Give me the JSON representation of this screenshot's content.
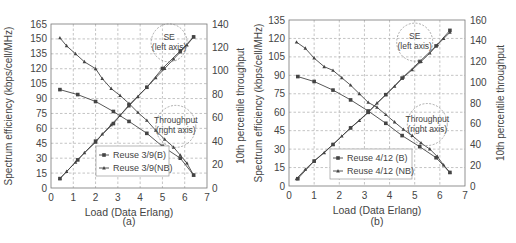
{
  "chart_data": [
    {
      "type": "line",
      "panel_label": "(a)",
      "title": "",
      "xlabel": "Load (Data Erlang)",
      "ylabel": "Spectrum efficiency (kbps/cell/MHz)",
      "y2label": "10th percentile throughput",
      "xlim": [
        0,
        7
      ],
      "ylim": [
        0,
        165
      ],
      "y2lim": [
        0,
        140
      ],
      "xticks": [
        0,
        1,
        2,
        3,
        4,
        5,
        6,
        7
      ],
      "yticks": [
        0,
        15,
        30,
        45,
        60,
        75,
        90,
        105,
        120,
        135,
        150,
        165
      ],
      "y2ticks": [
        0,
        20,
        40,
        60,
        80,
        100,
        120,
        140
      ],
      "grid": true,
      "legend": [
        "Reuse 3/9(B)",
        "Reuse 3/9(NB)"
      ],
      "annotations": [
        {
          "text": "SE",
          "text2": "(left axis)",
          "x": 5.3,
          "y": 146,
          "axis": "left"
        },
        {
          "text": "Throughput",
          "text2": "(right axis)",
          "x": 5.6,
          "y": 62,
          "axis": "left"
        }
      ],
      "series": [
        {
          "name": "Reuse 3/9(B)",
          "metric": "SE",
          "axis": "left",
          "marker": "square",
          "x": [
            0.4,
            1.2,
            2.0,
            2.8,
            3.5,
            4.3,
            5.0,
            5.8,
            6.4
          ],
          "values": [
            99,
            94,
            87,
            77,
            67,
            55,
            42,
            30,
            13
          ]
        },
        {
          "name": "Reuse 3/9(NB)",
          "metric": "SE",
          "axis": "left",
          "marker": "triangle",
          "x": [
            0.4,
            0.7,
            1.1,
            1.5,
            2.0,
            2.3,
            2.7,
            3.1,
            3.5,
            3.9,
            4.3,
            4.7,
            5.1,
            5.5,
            5.8,
            6.1,
            6.4
          ],
          "values": [
            151,
            143,
            135,
            127,
            120,
            110,
            100,
            93,
            85,
            76,
            68,
            58,
            49,
            41,
            33,
            25,
            13
          ]
        },
        {
          "name": "Reuse 3/9(B)",
          "metric": "Throughput",
          "axis": "right",
          "marker": "square",
          "x": [
            0.4,
            1.2,
            2.0,
            2.8,
            3.5,
            4.3,
            5.0,
            5.8,
            6.4
          ],
          "values": [
            8,
            24,
            40,
            55,
            71,
            86,
            102,
            117,
            129
          ]
        },
        {
          "name": "Reuse 3/9(NB)",
          "metric": "Throughput",
          "axis": "right",
          "marker": "triangle",
          "x": [
            0.4,
            0.7,
            1.1,
            1.5,
            2.0,
            2.3,
            2.7,
            3.1,
            3.5,
            3.9,
            4.3,
            4.7,
            5.1,
            5.5,
            5.8,
            6.1,
            6.4
          ],
          "values": [
            8,
            14,
            22,
            30,
            39,
            46,
            54,
            62,
            70,
            78,
            86,
            94,
            102,
            110,
            116,
            122,
            129
          ]
        }
      ]
    },
    {
      "type": "line",
      "panel_label": "(b)",
      "title": "",
      "xlabel": "Load (Data Erlang)",
      "ylabel": "Spectrum efficiency (kbps/cell/MHz)",
      "y2label": "10th percentile throughput",
      "xlim": [
        0,
        7
      ],
      "ylim": [
        0,
        135
      ],
      "y2lim": [
        0,
        160
      ],
      "xticks": [
        0,
        1,
        2,
        3,
        4,
        5,
        6,
        7
      ],
      "yticks": [
        0,
        15,
        30,
        45,
        60,
        75,
        90,
        105,
        120,
        135
      ],
      "y2ticks": [
        0,
        20,
        40,
        60,
        80,
        100,
        120,
        140,
        160
      ],
      "grid": true,
      "legend": [
        "Reuse 4/12 (B)",
        "Reuse 4/12 (NB)"
      ],
      "annotations": [
        {
          "text": "SE",
          "text2": "(left axis)",
          "x": 5.0,
          "y": 117,
          "axis": "left"
        },
        {
          "text": "Throughput",
          "text2": "(right axis)",
          "x": 5.5,
          "y": 50,
          "axis": "left"
        }
      ],
      "series": [
        {
          "name": "Reuse 4/12 (B)",
          "metric": "SE",
          "axis": "left",
          "marker": "square",
          "x": [
            0.35,
            1.0,
            1.75,
            2.45,
            3.15,
            3.85,
            4.5,
            5.2,
            5.85,
            6.4
          ],
          "values": [
            89,
            85,
            78,
            70,
            61,
            51,
            41,
            32,
            23,
            11
          ]
        },
        {
          "name": "Reuse 4/12 (NB)",
          "metric": "SE",
          "axis": "left",
          "marker": "triangle",
          "x": [
            0.3,
            0.65,
            1.0,
            1.4,
            1.75,
            2.1,
            2.45,
            2.8,
            3.15,
            3.5,
            3.85,
            4.2,
            4.55,
            4.9,
            5.25,
            5.6,
            5.9,
            6.15,
            6.4
          ],
          "values": [
            117,
            112,
            104,
            97,
            94,
            88,
            82,
            75,
            68,
            64,
            58,
            52,
            46,
            41,
            35,
            30,
            24,
            17,
            11
          ]
        },
        {
          "name": "Reuse 4/12 (B)",
          "metric": "Throughput",
          "axis": "right",
          "marker": "square",
          "x": [
            0.35,
            1.0,
            1.75,
            2.45,
            3.15,
            3.85,
            4.5,
            5.2,
            5.85,
            6.4
          ],
          "values": [
            7,
            24,
            40,
            56,
            71,
            88,
            104,
            120,
            135,
            150
          ]
        },
        {
          "name": "Reuse 4/12 (NB)",
          "metric": "Throughput",
          "axis": "right",
          "marker": "triangle",
          "x": [
            0.3,
            0.65,
            1.0,
            1.4,
            1.75,
            2.1,
            2.45,
            2.8,
            3.15,
            3.5,
            3.85,
            4.2,
            4.55,
            4.9,
            5.25,
            5.6,
            5.9,
            6.15,
            6.4
          ],
          "values": [
            7,
            16,
            24,
            32,
            40,
            48,
            56,
            63,
            71,
            80,
            88,
            96,
            105,
            112,
            120,
            128,
            136,
            142,
            148
          ]
        }
      ]
    }
  ],
  "colors": {
    "line": "#444444",
    "grid": "#aaaaaa",
    "axis": "#777777",
    "text": "#444444"
  }
}
